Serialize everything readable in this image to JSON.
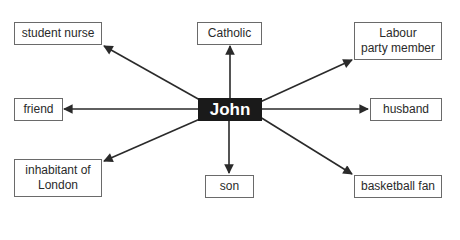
{
  "diagram": {
    "center": {
      "label": "John"
    },
    "nodes": [
      {
        "id": "student-nurse",
        "lines": [
          "student nurse"
        ]
      },
      {
        "id": "catholic",
        "lines": [
          "Catholic"
        ]
      },
      {
        "id": "labour-party-member",
        "lines": [
          "Labour",
          "party member"
        ]
      },
      {
        "id": "friend",
        "lines": [
          "friend"
        ]
      },
      {
        "id": "husband",
        "lines": [
          "husband"
        ]
      },
      {
        "id": "inhabitant-of-london",
        "lines": [
          "inhabitant of",
          "London"
        ]
      },
      {
        "id": "son",
        "lines": [
          "son"
        ]
      },
      {
        "id": "basketball-fan",
        "lines": [
          "basketball fan"
        ]
      }
    ],
    "edges": [
      {
        "from": "John",
        "to": "student nurse"
      },
      {
        "from": "John",
        "to": "Catholic"
      },
      {
        "from": "John",
        "to": "Labour party member"
      },
      {
        "from": "John",
        "to": "friend"
      },
      {
        "from": "John",
        "to": "husband"
      },
      {
        "from": "John",
        "to": "inhabitant of London"
      },
      {
        "from": "John",
        "to": "son"
      },
      {
        "from": "John",
        "to": "basketball fan"
      }
    ],
    "colors": {
      "center_fill": "#1a1a1a",
      "center_text": "#ffffff",
      "border": "#6a6a6a",
      "arrow": "#2a2a2a"
    }
  }
}
